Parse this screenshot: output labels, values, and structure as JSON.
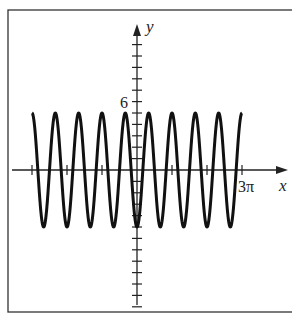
{
  "chart_data": {
    "type": "line",
    "title": "",
    "function": "y = -5 cos(3x)",
    "xlabel": "x",
    "ylabel": "y",
    "xlim": [
      -3.14159,
      9.42478
    ],
    "x_domain": [
      -9.42478,
      9.42478
    ],
    "ylim": [
      -12,
      11
    ],
    "amplitude": 5,
    "period": "2π/3",
    "x_ticks": [
      -9.42478,
      -6.28319,
      -3.14159,
      3.14159,
      6.28319,
      9.42478
    ],
    "x_tick_labels": [
      "",
      "",
      "",
      "",
      "",
      "3π"
    ],
    "y_tick_step": 1,
    "y_tick_labels": [
      {
        "value": 6,
        "label": "6"
      }
    ],
    "grid": false,
    "legend": null
  },
  "labels": {
    "x_axis": "x",
    "y_axis": "y",
    "x_tick_3pi": "3π",
    "y_tick_6": "6"
  },
  "colors": {
    "curve": "#111111",
    "axes": "#222222",
    "frame": "#333333"
  }
}
